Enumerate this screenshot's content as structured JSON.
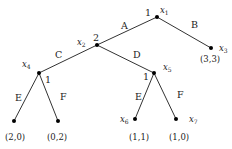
{
  "diagram": {
    "type": "extensive-form game tree",
    "nodes": [
      {
        "id": "x1",
        "name": "x",
        "sub": "1",
        "player": "1",
        "x": 157,
        "y": 17
      },
      {
        "id": "x2",
        "name": "x",
        "sub": "2",
        "player": "2",
        "x": 97,
        "y": 45
      },
      {
        "id": "x3",
        "name": "x",
        "sub": "3",
        "player": "",
        "x": 211,
        "y": 48,
        "payoff": "(3,3)"
      },
      {
        "id": "x4",
        "name": "x",
        "sub": "4",
        "player": "1",
        "x": 39,
        "y": 73
      },
      {
        "id": "x5",
        "name": "x",
        "sub": "5",
        "player": "1",
        "x": 154,
        "y": 73
      },
      {
        "id": "x6",
        "name": "x",
        "sub": "6",
        "player": "",
        "x": 135,
        "y": 119,
        "payoff": "(1,1)"
      },
      {
        "id": "x7",
        "name": "x",
        "sub": "7",
        "player": "",
        "x": 176,
        "y": 119,
        "payoff": "(1,0)"
      },
      {
        "id": "l1",
        "name": "",
        "sub": "",
        "player": "",
        "x": 14,
        "y": 121,
        "payoff": "(2,0)"
      },
      {
        "id": "l2",
        "name": "",
        "sub": "",
        "player": "",
        "x": 58,
        "y": 121,
        "payoff": "(0,2)"
      }
    ],
    "edges": [
      {
        "from": "x1",
        "to": "x2",
        "action": "A"
      },
      {
        "from": "x1",
        "to": "x3",
        "action": "B"
      },
      {
        "from": "x2",
        "to": "x4",
        "action": "C"
      },
      {
        "from": "x2",
        "to": "x5",
        "action": "D"
      },
      {
        "from": "x4",
        "to": "l1",
        "action": "E"
      },
      {
        "from": "x4",
        "to": "l2",
        "action": "F"
      },
      {
        "from": "x5",
        "to": "x6",
        "action": "E"
      },
      {
        "from": "x5",
        "to": "x7",
        "action": "F"
      }
    ],
    "labels": {
      "player_x1": "1",
      "player_x2": "2",
      "player_x4": "1",
      "player_x5": "1",
      "action_A": "A",
      "action_B": "B",
      "action_C": "C",
      "action_D": "D",
      "action_E_left": "E",
      "action_F_left": "F",
      "action_E_right": "E",
      "action_F_right": "F",
      "var_x": "x",
      "sub_1": "1",
      "sub_2": "2",
      "sub_3": "3",
      "sub_4": "4",
      "sub_5": "5",
      "sub_6": "6",
      "sub_7": "7",
      "payoff_x3": "(3,3)",
      "payoff_l1": "(2,0)",
      "payoff_l2": "(0,2)",
      "payoff_x6": "(1,1)",
      "payoff_x7": "(1,0)"
    }
  }
}
